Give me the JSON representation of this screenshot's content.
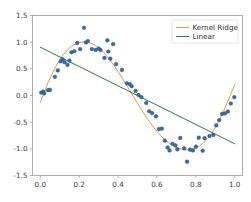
{
  "chart_data": {
    "type": "scatter",
    "title": "",
    "xlabel": "",
    "ylabel": "",
    "xlim": [
      -0.04,
      1.04
    ],
    "ylim": [
      -1.5,
      1.5
    ],
    "grid": false,
    "xticks": [
      "0.0",
      "0.2",
      "0.4",
      "0.6",
      "0.8",
      "1.0"
    ],
    "xtick_values": [
      0.0,
      0.2,
      0.4,
      0.6,
      0.8,
      1.0
    ],
    "yticks": [
      "1.5",
      "1.0",
      "0.5",
      "0.0",
      "-0.5",
      "-1.0",
      "-1.5"
    ],
    "ytick_values": [
      1.5,
      1.0,
      0.5,
      0.0,
      -0.5,
      -1.0,
      -1.5
    ],
    "legend_position": "upper right",
    "legend": [
      {
        "name": "Kernel Ridge",
        "color": "#e8954a",
        "marker": "line"
      },
      {
        "name": "Linear",
        "color": "#2f7d32",
        "marker": "line"
      }
    ],
    "scatter": {
      "name": "samples",
      "color": "#3b6ea5",
      "edge_color": "#2c4f78",
      "size": 9,
      "x": [
        0.005,
        0.015,
        0.02,
        0.04,
        0.05,
        0.075,
        0.09,
        0.105,
        0.115,
        0.125,
        0.14,
        0.15,
        0.16,
        0.175,
        0.19,
        0.205,
        0.225,
        0.235,
        0.245,
        0.265,
        0.285,
        0.3,
        0.31,
        0.33,
        0.345,
        0.35,
        0.36,
        0.375,
        0.39,
        0.42,
        0.445,
        0.46,
        0.47,
        0.49,
        0.505,
        0.52,
        0.545,
        0.56,
        0.575,
        0.595,
        0.61,
        0.625,
        0.64,
        0.655,
        0.665,
        0.68,
        0.695,
        0.705,
        0.72,
        0.74,
        0.755,
        0.77,
        0.785,
        0.8,
        0.815,
        0.835,
        0.845,
        0.87,
        0.89,
        0.905,
        0.92,
        0.935,
        0.95,
        0.965,
        0.98,
        0.998
      ],
      "y": [
        0.055,
        0.075,
        0.04,
        0.1,
        0.105,
        0.35,
        0.47,
        0.64,
        0.68,
        0.625,
        0.575,
        0.655,
        0.81,
        0.83,
        0.985,
        0.87,
        1.27,
        0.995,
        1.02,
        0.87,
        0.855,
        0.88,
        0.855,
        0.705,
        1.035,
        0.825,
        0.69,
        0.965,
        0.59,
        0.48,
        0.23,
        0.215,
        0.175,
        0.085,
        0.01,
        -0.03,
        -0.14,
        -0.295,
        -0.33,
        -0.39,
        -0.63,
        -0.62,
        -0.845,
        -0.975,
        -1.03,
        -0.905,
        -0.935,
        -1.01,
        -0.795,
        -0.99,
        -1.24,
        -1.015,
        -1.03,
        -0.96,
        -0.79,
        -1.035,
        -0.8,
        -0.76,
        -0.74,
        -0.56,
        -0.46,
        -0.345,
        -0.335,
        -0.3,
        -0.15,
        -0.03
      ]
    },
    "series": [
      {
        "name": "Kernel Ridge",
        "type": "line",
        "color": "#e8954a",
        "linewidth": 1.0,
        "x": [
          0.0,
          0.02,
          0.04,
          0.06,
          0.08,
          0.1,
          0.12,
          0.14,
          0.16,
          0.18,
          0.2,
          0.22,
          0.24,
          0.26,
          0.28,
          0.3,
          0.32,
          0.34,
          0.36,
          0.38,
          0.4,
          0.42,
          0.44,
          0.46,
          0.48,
          0.5,
          0.52,
          0.54,
          0.56,
          0.58,
          0.6,
          0.62,
          0.64,
          0.66,
          0.68,
          0.7,
          0.72,
          0.74,
          0.76,
          0.78,
          0.8,
          0.82,
          0.84,
          0.86,
          0.88,
          0.9,
          0.92,
          0.94,
          0.96,
          0.98,
          1.0
        ],
        "y": [
          -0.135,
          0.06,
          0.24,
          0.4,
          0.545,
          0.67,
          0.775,
          0.855,
          0.92,
          0.965,
          0.995,
          1.005,
          1.0,
          0.98,
          0.945,
          0.895,
          0.83,
          0.75,
          0.66,
          0.56,
          0.45,
          0.335,
          0.215,
          0.095,
          -0.025,
          -0.145,
          -0.265,
          -0.38,
          -0.485,
          -0.585,
          -0.675,
          -0.755,
          -0.825,
          -0.885,
          -0.935,
          -0.975,
          -1.0,
          -1.015,
          -1.02,
          -1.01,
          -0.985,
          -0.945,
          -0.885,
          -0.81,
          -0.715,
          -0.6,
          -0.465,
          -0.31,
          -0.145,
          0.03,
          0.195
        ]
      },
      {
        "name": "Linear",
        "type": "line",
        "color": "#2f7d32",
        "linewidth": 1.0,
        "x": [
          0.0,
          1.0
        ],
        "y": [
          0.905,
          -0.905
        ]
      }
    ]
  }
}
